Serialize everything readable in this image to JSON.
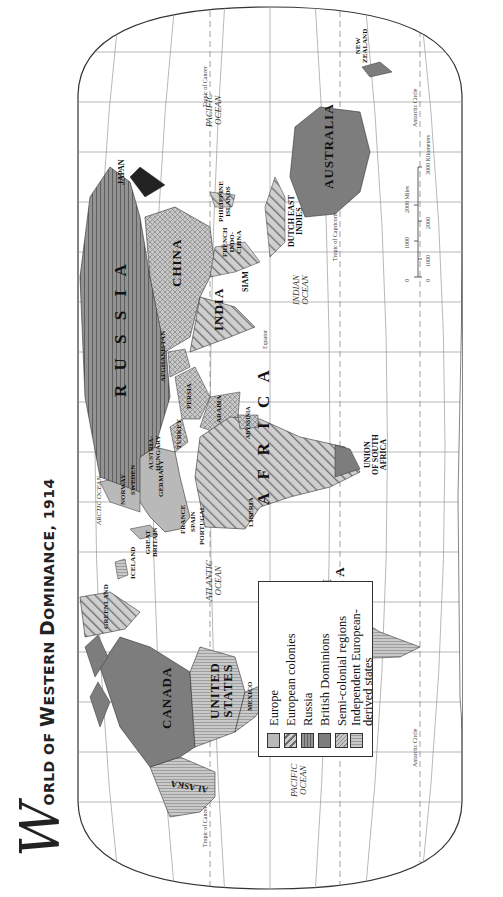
{
  "title": {
    "initial": "W",
    "rest_prefix": "ORLD OF ",
    "w2_initial": "W",
    "w2_rest": "ESTERN ",
    "d_initial": "D",
    "d_rest": "OMINANCE, 1914",
    "full": "World of Western Dominance, 1914"
  },
  "colors": {
    "europe": "#b9b9b9",
    "european_colonies_fill": "#c9c9c9",
    "european_colonies_hatch": "#6f6f6f",
    "russia_fill": "#8e8e8e",
    "russia_lines": "#6a6a6a",
    "british_dominions": "#7d7d7d",
    "semi_colonial": "#bdbdbd",
    "independent_european_derived": "#c4c4c4",
    "graticule": "#9a9a9a",
    "outline": "#333333"
  },
  "legend": {
    "items": [
      {
        "key": "europe",
        "label": "Europe"
      },
      {
        "key": "european_colonies",
        "label": "European colonies"
      },
      {
        "key": "russia",
        "label": "Russia"
      },
      {
        "key": "british_dominions",
        "label": "British Dominions"
      },
      {
        "key": "semi_colonial",
        "label": "Semi-colonial regions"
      },
      {
        "key": "independent",
        "label": "Independent European-"
      },
      {
        "key": "independent_cont",
        "label": "derived states"
      }
    ]
  },
  "regions": {
    "alaska": "ALASKA",
    "canada": "CANADA",
    "united_states_1": "UNITED",
    "united_states_2": "STATES",
    "mexico": "MEXICO",
    "central_america_1": "CENTRAL",
    "central_america_2": "AMERICA",
    "guianas": "GUIANAS",
    "south_america_1": "SOUTH",
    "south_america_2": "AMERICA",
    "greenland": "GREENLAND",
    "iceland": "ICELAND",
    "great_britain_1": "GREAT",
    "great_britain_2": "BRITAIN",
    "france": "FRANCE",
    "spain": "SPAIN",
    "portugal": "PORTUGAL",
    "norway": "NORWAY",
    "sweden": "SWEDEN",
    "germany": "GERMANY",
    "austria_hungary_1": "AUSTRIA-",
    "austria_hungary_2": "HUNGARY",
    "turkey": "TURKEY",
    "russia": "R U S S I A",
    "afghanistan": "AFGHANISTAN",
    "persia": "PERSIA",
    "arabia": "ARABIA",
    "abyssinia": "ABYSSINIA",
    "africa": "A F R I C A",
    "liberia": "LIBERIA",
    "union_sa_1": "UNION",
    "union_sa_2": "OF SOUTH",
    "union_sa_3": "AFRICA",
    "india": "INDIA",
    "china": "CHINA",
    "siam": "SIAM",
    "french_indochina_1": "FRENCH",
    "french_indochina_2": "INDO-",
    "french_indochina_3": "CHINA",
    "philippine_1": "PHILIPPINE",
    "philippine_2": "ISLANDS",
    "dutch_east_indies_1": "DUTCH EAST",
    "dutch_east_indies_2": "INDIES",
    "japan": "JAPAN",
    "australia": "AUSTRALIA",
    "new_zealand_1": "NEW",
    "new_zealand_2": "ZEALAND"
  },
  "oceans": {
    "pacific_west_1": "PACIFIC",
    "pacific_west_2": "OCEAN",
    "atlantic_1": "ATLANTIC",
    "atlantic_2": "OCEAN",
    "arctic_1": "ARCTIC",
    "arctic_2": "OCEAN",
    "indian_1": "INDIAN",
    "indian_2": "OCEAN",
    "pacific_east_1": "PACIFIC",
    "pacific_east_2": "OCEAN"
  },
  "lines": {
    "equator": "Equator",
    "tropic_cancer": "Tropic of Cancer",
    "tropic_capricorn": "Tropic of Capricorn",
    "antarctic_circle": "Antarctic Circle",
    "arctic_circle": "Arctic Circle"
  },
  "graticule_labels": {
    "top": [
      "180°",
      "160°",
      "140°",
      "120°",
      "100°",
      "80°",
      "60°",
      "40°",
      "20°",
      "0°",
      "20°",
      "40°",
      "60°",
      "80°",
      "100°",
      "120°",
      "140°",
      "160°"
    ],
    "lat_left": [
      "60°",
      "40°",
      "20°"
    ],
    "lat_right": [
      "20°",
      "40°",
      "60°"
    ]
  },
  "scale": {
    "miles_ticks": [
      "0",
      "1000",
      "2000 Miles"
    ],
    "km_ticks": [
      "0",
      "1000",
      "2000",
      "3000 Kilometers"
    ]
  }
}
